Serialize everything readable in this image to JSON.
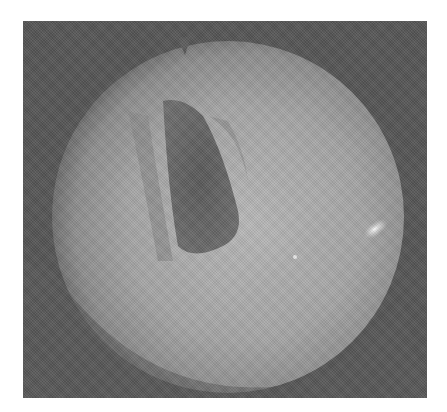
{
  "image": {
    "description": "Grayscale circular endoscopic view of the larynx",
    "frame": {
      "x": 23,
      "y": 21,
      "width": 404,
      "height": 377,
      "color": "#555555"
    },
    "field_of_view": {
      "cx": 205,
      "cy": 194,
      "r": 176,
      "color": "#a8a8a8"
    },
    "glottis": {
      "color": "#5e5e5e"
    },
    "highlight": {
      "color": "#f4f4f4"
    }
  }
}
